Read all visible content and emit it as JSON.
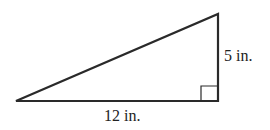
{
  "diagram": {
    "type": "right-triangle",
    "labels": {
      "height": "5 in.",
      "base": "12 in."
    },
    "colors": {
      "stroke": "#2a2a2a",
      "background": "#ffffff"
    }
  }
}
